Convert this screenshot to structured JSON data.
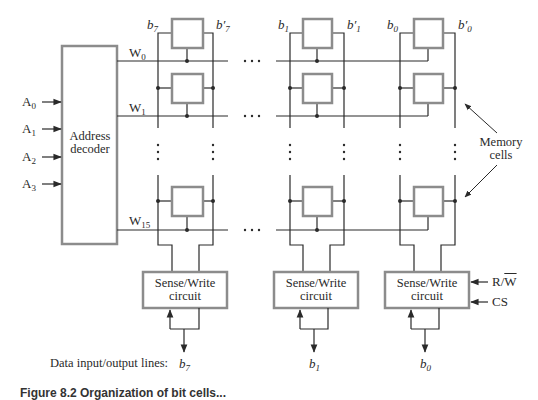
{
  "diagram": {
    "decoder": {
      "label_line1": "Address",
      "label_line2": "decoder"
    },
    "address_inputs": [
      {
        "name": "A",
        "index": "0"
      },
      {
        "name": "A",
        "index": "1"
      },
      {
        "name": "A",
        "index": "2"
      },
      {
        "name": "A",
        "index": "3"
      }
    ],
    "word_lines": [
      {
        "name": "W",
        "index": "0"
      },
      {
        "name": "W",
        "index": "1"
      },
      {
        "name": "W",
        "index": "15"
      }
    ],
    "bit_columns": [
      {
        "bit": "b",
        "index": "7",
        "bit_prime": "b′",
        "prime_index": "7",
        "output": "7"
      },
      {
        "bit": "b",
        "index": "1",
        "bit_prime": "b′",
        "prime_index": "1",
        "output": "1"
      },
      {
        "bit": "b",
        "index": "0",
        "bit_prime": "b′",
        "prime_index": "0",
        "output": "0"
      }
    ],
    "sense_write": {
      "line1": "Sense/Write",
      "line2": "circuit"
    },
    "control_inputs": {
      "rw_r": "R/",
      "rw_w": "W",
      "cs": "CS"
    },
    "memory_cells_label": {
      "line1": "Memory",
      "line2": "cells"
    },
    "data_lines_label": "Data input/output lines:",
    "ellipsis": "· · ·",
    "caption_partial": "Figure 8.2  Organization of bit cells..."
  },
  "colors": {
    "line": "#2a2a2a",
    "box_stroke": "#8c8c8c",
    "background": "#ffffff"
  }
}
